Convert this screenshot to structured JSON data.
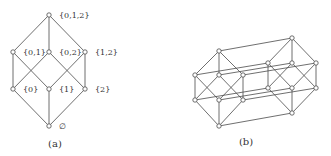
{
  "figure": {
    "panel_a": {
      "caption": "(a)",
      "caption_pos": [
        55,
        147
      ],
      "nodes": [
        {
          "id": "012",
          "label": "{0,1,2}",
          "x": 49,
          "y": 15,
          "lx": 59,
          "ly": 18
        },
        {
          "id": "01",
          "label": "{0,1}",
          "x": 13,
          "y": 52,
          "lx": 23,
          "ly": 55
        },
        {
          "id": "02",
          "label": "{0,2}",
          "x": 49,
          "y": 52,
          "lx": 59,
          "ly": 55
        },
        {
          "id": "12",
          "label": "{1,2}",
          "x": 85,
          "y": 52,
          "lx": 95,
          "ly": 55
        },
        {
          "id": "0",
          "label": "{0}",
          "x": 13,
          "y": 89,
          "lx": 23,
          "ly": 92
        },
        {
          "id": "1",
          "label": "{1}",
          "x": 49,
          "y": 89,
          "lx": 59,
          "ly": 92
        },
        {
          "id": "2",
          "label": "{2}",
          "x": 85,
          "y": 89,
          "lx": 95,
          "ly": 92
        },
        {
          "id": "e",
          "label": "∅",
          "x": 49,
          "y": 126,
          "lx": 59,
          "ly": 129
        }
      ],
      "edges": [
        [
          "012",
          "01"
        ],
        [
          "012",
          "02"
        ],
        [
          "012",
          "12"
        ],
        [
          "01",
          "0"
        ],
        [
          "01",
          "1"
        ],
        [
          "02",
          "0"
        ],
        [
          "02",
          "2"
        ],
        [
          "12",
          "1"
        ],
        [
          "12",
          "2"
        ],
        [
          "0",
          "e"
        ],
        [
          "1",
          "e"
        ],
        [
          "2",
          "e"
        ]
      ]
    },
    "panel_b": {
      "caption": "(b)",
      "caption_pos": [
        246,
        145
      ],
      "nodes": [
        {
          "id": "LT",
          "x": 219,
          "y": 51
        },
        {
          "id": "LM1",
          "x": 195,
          "y": 75
        },
        {
          "id": "LM2",
          "x": 219,
          "y": 75
        },
        {
          "id": "LM3",
          "x": 243,
          "y": 75
        },
        {
          "id": "LL1",
          "x": 195,
          "y": 100
        },
        {
          "id": "LL2",
          "x": 219,
          "y": 100
        },
        {
          "id": "LL3",
          "x": 243,
          "y": 100
        },
        {
          "id": "LB",
          "x": 219,
          "y": 126
        },
        {
          "id": "RT",
          "x": 292,
          "y": 38
        },
        {
          "id": "RM1",
          "x": 268,
          "y": 63
        },
        {
          "id": "RM2",
          "x": 292,
          "y": 63
        },
        {
          "id": "RM3",
          "x": 316,
          "y": 63
        },
        {
          "id": "RL1",
          "x": 268,
          "y": 88
        },
        {
          "id": "RL2",
          "x": 292,
          "y": 88
        },
        {
          "id": "RL3",
          "x": 316,
          "y": 88
        },
        {
          "id": "RB",
          "x": 292,
          "y": 113
        }
      ],
      "edges": [
        [
          "LT",
          "LM1"
        ],
        [
          "LT",
          "LM2"
        ],
        [
          "LT",
          "LM3"
        ],
        [
          "LM1",
          "LL1"
        ],
        [
          "LM1",
          "LL2"
        ],
        [
          "LM2",
          "LL1"
        ],
        [
          "LM2",
          "LL3"
        ],
        [
          "LM3",
          "LL2"
        ],
        [
          "LM3",
          "LL3"
        ],
        [
          "LL1",
          "LB"
        ],
        [
          "LL2",
          "LB"
        ],
        [
          "LL3",
          "LB"
        ],
        [
          "RT",
          "RM1"
        ],
        [
          "RT",
          "RM2"
        ],
        [
          "RT",
          "RM3"
        ],
        [
          "RM1",
          "RL1"
        ],
        [
          "RM1",
          "RL2"
        ],
        [
          "RM2",
          "RL1"
        ],
        [
          "RM2",
          "RL3"
        ],
        [
          "RM3",
          "RL2"
        ],
        [
          "RM3",
          "RL3"
        ],
        [
          "RL1",
          "RB"
        ],
        [
          "RL2",
          "RB"
        ],
        [
          "RL3",
          "RB"
        ],
        [
          "LT",
          "RT"
        ],
        [
          "LM1",
          "RM1"
        ],
        [
          "LM2",
          "RM2"
        ],
        [
          "LM3",
          "RM3"
        ],
        [
          "LL1",
          "RL1"
        ],
        [
          "LL2",
          "RL2"
        ],
        [
          "LL3",
          "RL3"
        ],
        [
          "LB",
          "RB"
        ]
      ]
    }
  }
}
